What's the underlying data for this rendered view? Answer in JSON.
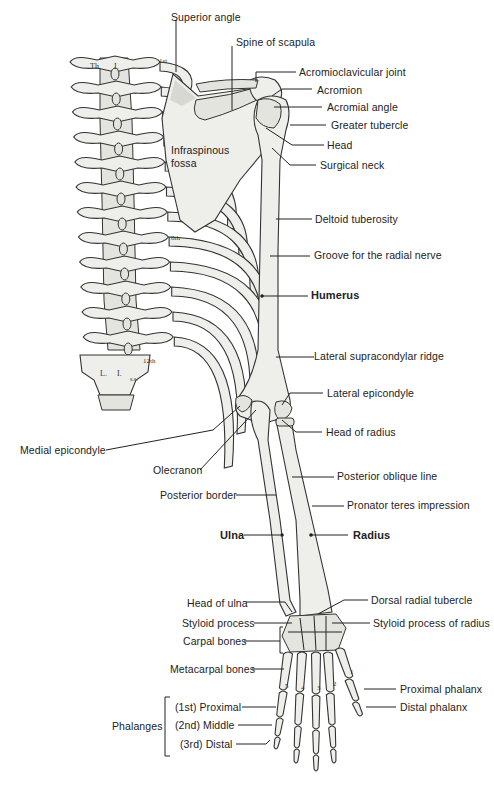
{
  "spine_labels": {
    "thoracic_left": "Th.",
    "thoracic_right": "I.",
    "lumbar_left": "L.",
    "lumbar_right": "I.",
    "sacral_mark": "s.s."
  },
  "rib_labels": {
    "first": "1st",
    "eighth": "8th",
    "twelfth": "12th"
  },
  "finger_numbers": [
    "5",
    "4",
    "3",
    "2",
    "1"
  ],
  "labels": {
    "superior_angle": "Superior angle",
    "spine_of_scapula": "Spine of scapula",
    "acromioclavicular_joint": "Acromioclavicular joint",
    "acromion": "Acromion",
    "acromial_angle": "Acromial angle",
    "greater_tubercle": "Greater tubercle",
    "head": "Head",
    "surgical_neck": "Surgical neck",
    "infraspinous_fossa_line1": "Infraspinous",
    "infraspinous_fossa_line2": "fossa",
    "deltoid_tuberosity": "Deltoid tuberosity",
    "groove_radial_nerve": "Groove for the radial nerve",
    "humerus": "Humerus",
    "lateral_supracondylar_ridge": "Lateral supracondylar ridge",
    "lateral_epicondyle": "Lateral epicondyle",
    "head_of_radius": "Head of radius",
    "medial_epicondyle": "Medial epicondyle",
    "olecranon": "Olecranon",
    "posterior_oblique_line": "Posterior oblique line",
    "posterior_border": "Posterior border",
    "pronator_teres_impression": "Pronator teres impression",
    "ulna": "Ulna",
    "radius": "Radius",
    "head_of_ulna": "Head of ulna",
    "dorsal_radial_tubercle": "Dorsal radial tubercle",
    "styloid_process": "Styloid process",
    "styloid_process_of_radius": "Styloid process of radius",
    "carpal_bones": "Carpal bones",
    "metacarpal_bones": "Metacarpal bones",
    "proximal_phalanx": "Proximal phalanx",
    "distal_phalanx": "Distal phalanx",
    "phalanges": "Phalanges",
    "first_proximal": "(1st) Proximal",
    "second_middle": "(2nd) Middle",
    "third_distal": "(3rd) Distal"
  }
}
